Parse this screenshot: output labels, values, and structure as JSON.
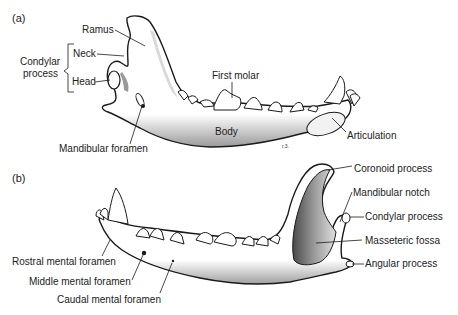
{
  "figure": {
    "panel_a": {
      "tag": "(a)",
      "view": "lateral view of mandible (rostral end right)",
      "labels": {
        "ramus": "Ramus",
        "condylar_process": "Condylar\nprocess",
        "condylar_process_line1": "Condylar",
        "condylar_process_line2": "process",
        "neck": "Neck",
        "head": "Head",
        "first_molar": "First molar",
        "body": "Body",
        "articulation": "Articulation",
        "mandibular_foramen": "Mandibular foramen"
      },
      "signature": "r.3."
    },
    "panel_b": {
      "tag": "(b)",
      "view": "lateral view of mandible (rostral end left)",
      "labels": {
        "coronoid_process": "Coronoid process",
        "mandibular_notch": "Mandibular notch",
        "condylar_process": "Condylar process",
        "masseteric_fossa": "Masseteric fossa",
        "angular_process": "Angular process",
        "rostral_mental_foramen": "Rostral mental foramen",
        "middle_mental_foramen": "Middle mental foramen",
        "caudal_mental_foramen": "Caudal mental foramen"
      }
    },
    "colors": {
      "ink": "#1a1a1a",
      "shade": "#8a8a8a",
      "bone": "#ffffff",
      "background": "#ffffff"
    }
  }
}
